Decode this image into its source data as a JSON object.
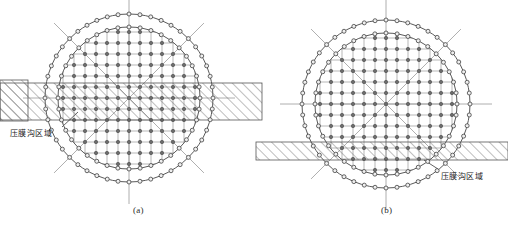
{
  "figure": {
    "title_visible": false,
    "background": "#ffffff",
    "panels": [
      {
        "id": "a",
        "caption": "(a)",
        "caption_x": 133,
        "caption_y": 205,
        "center": {
          "x": 129,
          "y": 98
        },
        "outer_radius": 84,
        "inner_radius": 71,
        "outer_node_count": 48,
        "inner_node_count": 40,
        "grid_spacing": 11,
        "grid_cols": 12,
        "grid_rows": 12,
        "band": {
          "label": "压膜沟区域",
          "label_x": 10,
          "label_y": 127,
          "top": 83,
          "bottom": 120,
          "left": 0,
          "right": 262,
          "hatch_direction": "up-right",
          "leader_from_x": 62,
          "leader_from_y": 127,
          "leader_to_x": 78,
          "leader_to_y": 112
        },
        "axes": {
          "vertical": true,
          "horizontal": true,
          "diagonals": true,
          "overshoot": 22
        }
      },
      {
        "id": "b",
        "caption": "(b)",
        "caption_x": 381,
        "caption_y": 205,
        "center": {
          "x": 386,
          "y": 104
        },
        "outer_radius": 84,
        "inner_radius": 71,
        "outer_node_count": 48,
        "inner_node_count": 40,
        "grid_spacing": 11,
        "grid_cols": 12,
        "grid_rows": 12,
        "band": {
          "label": "压膜沟区域",
          "label_x": 441,
          "label_y": 170,
          "top": 142,
          "bottom": 160,
          "left": 256,
          "right": 508,
          "hatch_direction": "up-right",
          "leader_from_x": 438,
          "leader_from_y": 169,
          "leader_to_x": 424,
          "leader_to_y": 160
        },
        "axes": {
          "vertical": true,
          "horizontal": true,
          "diagonals": true,
          "overshoot": 22
        }
      }
    ],
    "stub_band": {
      "left": 0,
      "right": 28,
      "top": 80,
      "bottom": 121,
      "hatch_direction": "up-right"
    },
    "colors": {
      "line": "#5a5a5a",
      "node_stroke": "#4a4a4a",
      "node_fill": "#6b6b6b",
      "grid": "#9a9a9a",
      "hatch": "#6f6f6f",
      "band_outline": "#555555",
      "text": "#222222",
      "caption": "#2b2b2b",
      "background": "#ffffff"
    }
  }
}
